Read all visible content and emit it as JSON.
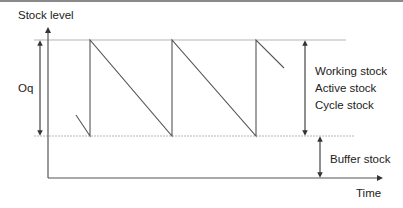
{
  "diagram": {
    "y_axis_label": "Stock level",
    "x_axis_label": "Time",
    "order_quantity_label": "Oq",
    "working_stock_labels": [
      "Working stock",
      "Active stock",
      "Cycle stock"
    ],
    "buffer_stock_label": "Buffer stock",
    "colors": {
      "line": "#555555",
      "guide": "#b5b5b5",
      "text": "#222222",
      "top_border": "#8a8a8a"
    }
  }
}
